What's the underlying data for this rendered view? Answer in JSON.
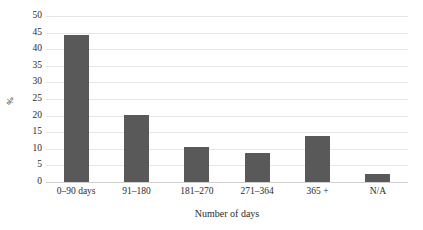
{
  "chart_data": {
    "type": "bar",
    "title": "",
    "xlabel": "Number of days",
    "ylabel": "%",
    "categories": [
      "0–90 days",
      "91–180",
      "181–270",
      "271–364",
      "365 +",
      "N/A"
    ],
    "values": [
      44.3,
      20.3,
      10.6,
      8.6,
      14.0,
      2.5
    ],
    "ylim": [
      0,
      50
    ],
    "yticks": [
      0,
      5,
      10,
      15,
      20,
      25,
      30,
      35,
      40,
      45,
      50
    ],
    "ytick_labels": [
      "0",
      "5",
      "10",
      "15",
      "20",
      "25",
      "30",
      "35",
      "40",
      "45",
      "50"
    ],
    "grid": true,
    "legend": false,
    "bar_color": "#595959",
    "gridline_color": "#e6e6e6",
    "background_color": "#ffffff"
  }
}
